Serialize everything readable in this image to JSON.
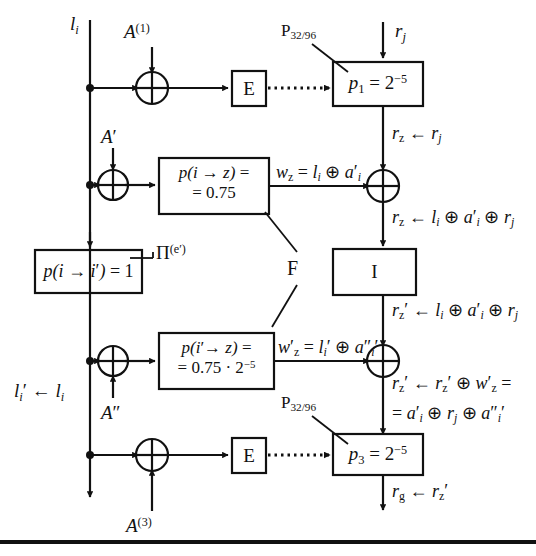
{
  "figure": {
    "type": "cryptanalysis-trail-diagram",
    "background": "#ffffff",
    "ink": "#111111"
  },
  "left_column": {
    "input_label": "l_i",
    "output_label": "l_i' ← l_i",
    "xor1_key": "A^(1)",
    "xor2_key": "A'",
    "xor3_key": "A''",
    "xor4_key": "A^(3)"
  },
  "boxes": {
    "e_top": {
      "label": "E",
      "name": "e-box-top"
    },
    "e_bottom": {
      "label": "E",
      "name": "e-box-bottom"
    },
    "i_box": {
      "label": "I",
      "name": "i-box"
    },
    "p1": {
      "label": "p_1 = 2^-5",
      "tag": "P_32/96"
    },
    "p3": {
      "label": "p_3 = 2^-5",
      "tag": "P_32/96"
    },
    "pz_top": {
      "line1": "p(i → z) =",
      "line2": "= 0.75"
    },
    "pz_bottom": {
      "line1": "p(i' → z) =",
      "line2": "= 0.75 · 2^-5"
    },
    "pii": {
      "label": "p(i → i') = 1",
      "tag": "Π^(e')"
    }
  },
  "annotations": {
    "f_label": "F",
    "pi_label": "Π^(e')",
    "p_tag_top": "P_32/96",
    "p_tag_bottom": "P_32/96"
  },
  "right_column": {
    "input_label": "r_j",
    "after_p1": "r_z ← r_j",
    "after_xor_top": "r_z ← l_i ⊕ a'_i ⊕ r_j",
    "after_i": "r_z' ← l_i ⊕ a'_i ⊕ r_j",
    "after_xor_bottom_line1": "r_z' ← r_z' ⊕ w'_z =",
    "after_xor_bottom_line2": "= a'_i ⊕ r_j ⊕ a''_i'",
    "output_label": "r_g ← r_z'"
  },
  "wire_labels": {
    "w_top": "w_z = l_i ⊕ a'_i",
    "w_bottom": "w'_z = l_i' ⊕ a''_i'"
  }
}
